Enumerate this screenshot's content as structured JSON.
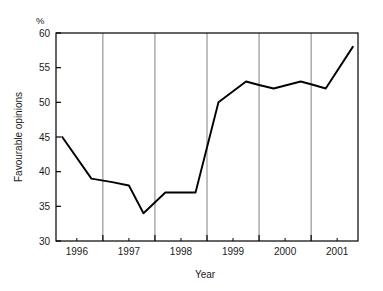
{
  "chart_data": {
    "type": "line",
    "title": "",
    "subtitle": "",
    "xlabel": "Year",
    "ylabel": "Favourable opinions",
    "unit_label": "%",
    "xlim": [
      1995.6,
      2001.4
    ],
    "ylim": [
      30,
      60
    ],
    "yticks": [
      30,
      35,
      40,
      45,
      50,
      55,
      60
    ],
    "ytick_labels": [
      "30",
      "35",
      "40",
      "45",
      "50",
      "55",
      "60"
    ],
    "xtick_labels": [
      "1996",
      "1997",
      "1998",
      "1999",
      "2000",
      "2001"
    ],
    "xtick_positions": [
      1996,
      1997,
      1998,
      1999,
      2000,
      2001
    ],
    "gridlines_x": [
      1996.5,
      1997.5,
      1998.5,
      1999.5,
      2000.5
    ],
    "grid": "vertical-only",
    "legend": "none",
    "line_color": "#000000",
    "grid_color": "#808080",
    "axis_color": "#000000",
    "background_color": "#ffffff",
    "series": [
      {
        "name": "Favourable opinions",
        "x": [
          1995.72,
          1996.28,
          1996.68,
          1997.0,
          1997.28,
          1997.7,
          1998.28,
          1998.72,
          1999.25,
          1999.5,
          1999.78,
          2000.3,
          2000.55,
          2000.78,
          2001.3
        ],
        "values": [
          45,
          39,
          38.5,
          38,
          34,
          37,
          37,
          50,
          53,
          52.5,
          52,
          53,
          52.5,
          52,
          58
        ]
      }
    ]
  }
}
